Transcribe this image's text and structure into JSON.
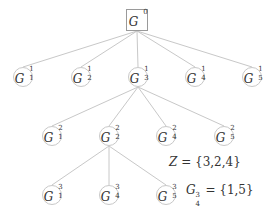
{
  "diagram": {
    "root": {
      "label": "G",
      "sup": "0"
    },
    "level1": [
      {
        "label": "G",
        "sup": "1",
        "sub": "1"
      },
      {
        "label": "G",
        "sup": "1",
        "sub": "2"
      },
      {
        "label": "G",
        "sup": "1",
        "sub": "3"
      },
      {
        "label": "G",
        "sup": "1",
        "sub": "4"
      },
      {
        "label": "G",
        "sup": "1",
        "sub": "5"
      }
    ],
    "level2": [
      {
        "label": "G",
        "sup": "2",
        "sub": "1"
      },
      {
        "label": "G",
        "sup": "2",
        "sub": "2"
      },
      {
        "label": "G",
        "sup": "2",
        "sub": "4"
      },
      {
        "label": "G",
        "sup": "2",
        "sub": "5"
      }
    ],
    "level3": [
      {
        "label": "G",
        "sup": "3",
        "sub": "1"
      },
      {
        "label": "G",
        "sup": "3",
        "sub": "4"
      },
      {
        "label": "G",
        "sup": "3",
        "sub": "5"
      }
    ],
    "annotations": {
      "z_var": "Z",
      "z_value": " = {3,2,4}",
      "g_label": "G",
      "g_sup": "3",
      "g_sub": "4",
      "g_value": " = {1,5}"
    },
    "edges": [
      [
        "G^0",
        "G^1_1"
      ],
      [
        "G^0",
        "G^1_2"
      ],
      [
        "G^0",
        "G^1_3"
      ],
      [
        "G^0",
        "G^1_4"
      ],
      [
        "G^0",
        "G^1_5"
      ],
      [
        "G^1_3",
        "G^2_1"
      ],
      [
        "G^1_3",
        "G^2_2"
      ],
      [
        "G^1_3",
        "G^2_4"
      ],
      [
        "G^1_3",
        "G^2_5"
      ],
      [
        "G^2_2",
        "G^3_1"
      ],
      [
        "G^2_2",
        "G^3_4"
      ],
      [
        "G^2_2",
        "G^3_5"
      ]
    ],
    "colors": {
      "edge": "#c8c8c8",
      "node_border": "#c8c8c8",
      "text": "#333333"
    }
  }
}
